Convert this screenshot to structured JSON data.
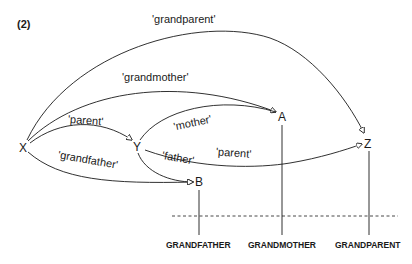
{
  "figure": {
    "number_label": "(2)",
    "nodes": {
      "x": "X",
      "y": "Y",
      "a": "A",
      "b": "B",
      "z": "Z"
    },
    "relations": {
      "grandparent": "'grandparent'",
      "grandmother": "'grandmother'",
      "parent_xy": "'parent'",
      "mother": "'mother'",
      "father": "'father'",
      "parent_yz": "'parent'",
      "grandfather": "'grandfather'"
    },
    "concepts": {
      "grandfather": "GRANDFATHER",
      "grandmother": "GRANDMOTHER",
      "grandparent": "GRANDPARENT"
    },
    "colors": {
      "ink": "#1a1a1a",
      "background": "#ffffff"
    }
  }
}
